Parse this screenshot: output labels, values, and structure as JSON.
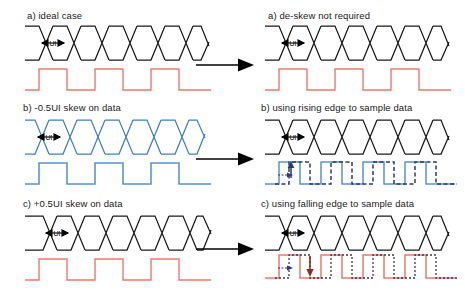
{
  "figure": {
    "title_visible": false,
    "background": "#ffffff"
  },
  "colors": {
    "eye_black": "#1a1a1a",
    "eye_blue": "#3f7ec4",
    "clock_red": "#e8796d",
    "clock_blue": "#5a93d0",
    "clock_dashed_navy": "#2b3a6b",
    "clock_dotted_dark": "#3a3a55",
    "arrow_black": "#000000",
    "arrow_down_red": "#8c2b22",
    "arrow_small_blue": "#2b3a8c",
    "text": "#1a1a1a"
  },
  "panels": {
    "left": [
      {
        "id": "ideal-case",
        "caption": "a) ideal case",
        "eye_color": "#1a1a1a",
        "clock_color": "#e8796d",
        "ui_label": "UI",
        "eye_phase": "aligned",
        "clock_style": "solid"
      },
      {
        "id": "minus-half-ui-skew",
        "caption": "b) -0.5UI skew on data",
        "eye_color": "#3f7ec4",
        "clock_color": "#5a93d0",
        "ui_label": "UI",
        "eye_phase": "shifted-left",
        "clock_style": "solid"
      },
      {
        "id": "plus-half-ui-skew",
        "caption": "c) +0.5UI skew on data",
        "eye_color": "#1a1a1a",
        "clock_color": "#e8796d",
        "ui_label": "UI",
        "eye_phase": "shifted-right",
        "clock_style": "solid"
      }
    ],
    "right": [
      {
        "id": "de-skew-not-required",
        "caption": "a) de-skew not required",
        "eye_color": "#1a1a1a",
        "clock_color": "#e8796d",
        "ui_label": "UI",
        "clock_style": "solid",
        "overlay": false,
        "annotation": null
      },
      {
        "id": "rising-edge-sample",
        "caption": "b) using rising edge to sample data",
        "eye_color": "#1a1a1a",
        "clock_color": "#5a93d0",
        "overlay_color": "#2b3a6b",
        "ui_label": "UI",
        "clock_style": "solid-plus-dashed",
        "overlay": true,
        "annotation": {
          "shift_arrow": "right",
          "edge_arrow": "up",
          "edge_arrow_color": "#2b3a6b"
        }
      },
      {
        "id": "falling-edge-sample",
        "caption": "c) using falling edge to sample data",
        "eye_color": "#1a1a1a",
        "clock_color": "#e8796d",
        "overlay_color": "#3a3a55",
        "ui_label": "UI",
        "clock_style": "solid-plus-dotted",
        "overlay": true,
        "annotation": {
          "shift_arrow": "right",
          "edge_arrow": "down",
          "edge_arrow_color": "#8c2b22"
        }
      }
    ]
  },
  "connectors": [
    {
      "id": "connector-a",
      "direction": "right"
    },
    {
      "id": "connector-b",
      "direction": "right"
    },
    {
      "id": "connector-c",
      "direction": "right"
    }
  ]
}
